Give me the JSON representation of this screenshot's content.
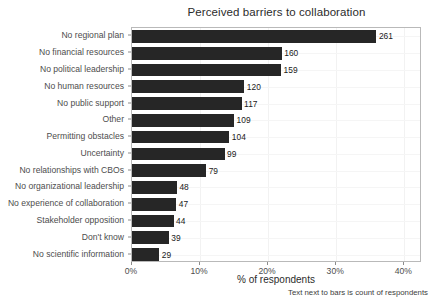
{
  "chart_data": {
    "type": "bar",
    "orientation": "horizontal",
    "title": "Perceived barriers to collaboration",
    "xlabel": "% of respondents",
    "ylabel": "",
    "categories": [
      "No regional plan",
      "No financial resources",
      "No political leadership",
      "No human resources",
      "No public support",
      "Other",
      "Permitting obstacles",
      "Uncertainty",
      "No relationships with CBOs",
      "No organizational leadership",
      "No experience of collaboration",
      "Stakeholder opposition",
      "Don't know",
      "No scientific information"
    ],
    "values_percent": [
      35.9,
      22.0,
      21.9,
      16.5,
      16.1,
      15.0,
      14.3,
      13.6,
      10.9,
      6.6,
      6.5,
      6.1,
      5.4,
      4.0
    ],
    "counts": [
      261,
      160,
      159,
      120,
      117,
      109,
      104,
      99,
      79,
      48,
      47,
      44,
      39,
      29
    ],
    "xtick_labels": [
      "0%",
      "10%",
      "20%",
      "30%",
      "40%"
    ],
    "xtick_values": [
      0,
      10,
      20,
      30,
      40
    ],
    "xlim": [
      0,
      42.6
    ],
    "grid": true,
    "legend": false,
    "bar_color": "#262626",
    "annotation": "Text next to bars is count of respondents"
  }
}
